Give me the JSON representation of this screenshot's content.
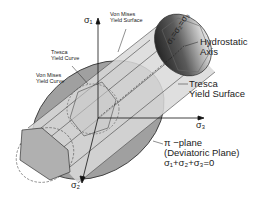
{
  "labels": {
    "sigma1": "σ₁",
    "sigma2": "σ₂",
    "sigma3": "σ₃",
    "von_mises_surface_line1": "Von Mises",
    "von_mises_surface_line2": "Yield Surface",
    "tresca_curve_line1": "Tresca",
    "tresca_curve_line2": "Yield Curve",
    "von_mises_curve_line1": "Von Mises",
    "von_mises_curve_line2": "Yield Curve",
    "hydrostatic_eq": "σ₁=σ₂=σ₃",
    "hydrostatic_line1": "Hydrostatic",
    "hydrostatic_line2": "Axis",
    "tresca_surface_line1": "Tresca",
    "tresca_surface_line2": "Yield Surface",
    "pi_plane_line1": "π −plane",
    "pi_plane_line2": "(Deviatoric Plane)",
    "pi_plane_eq": "σ₁+σ₂+σ₃=0"
  },
  "colors": {
    "pi_plane": "#9a9a9a",
    "cylinder": "#d4d4d4",
    "hexagon": "#b3b3b3",
    "cap_dark": "#333333",
    "line": "#222222"
  }
}
